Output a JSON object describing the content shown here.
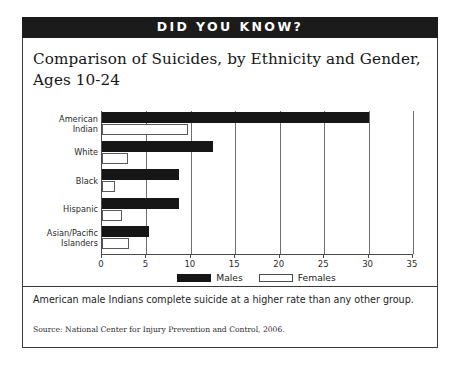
{
  "header": {
    "banner_title": "DID YOU KNOW?"
  },
  "chart_title": "Comparison of Suicides, by Ethnicity and Gender, Ages 10-24",
  "caption": "American male Indians complete suicide at a higher rate than any other group.",
  "source": "Source: National Center for Injury Prevention and Control, 2006.",
  "colors": {
    "males": "#161616",
    "females": "#ffffff",
    "female_border": "#5a5a5a",
    "banner_bg": "#1b1b1b",
    "banner_text": "#ffffff",
    "frame": "#3a3a3a",
    "grid": "#6e6e6e"
  },
  "chart_data": {
    "type": "bar",
    "orientation": "horizontal",
    "title": "Comparison of Suicides, by Ethnicity and Gender, Ages 10-24",
    "xlabel": "",
    "ylabel": "",
    "xlim": [
      0,
      35
    ],
    "xticks": [
      0,
      5,
      10,
      15,
      20,
      25,
      30,
      35
    ],
    "xtick_labels": [
      "0",
      "5",
      "10",
      "15",
      "20",
      "25",
      "30",
      "35"
    ],
    "grid": true,
    "legend_position": "bottom-center",
    "categories": [
      "American Indian",
      "White",
      "Black",
      "Hispanic",
      "Asian/Pacific Islanders"
    ],
    "category_label_lines": [
      [
        "American",
        "Indian"
      ],
      [
        "White"
      ],
      [
        "Black"
      ],
      [
        "Hispanic"
      ],
      [
        "Asian/Pacific",
        "Islanders"
      ]
    ],
    "series": [
      {
        "name": "Males",
        "values": [
          30.0,
          12.5,
          8.7,
          8.7,
          5.3
        ]
      },
      {
        "name": "Females",
        "values": [
          9.7,
          2.9,
          1.5,
          2.2,
          3.0
        ]
      }
    ],
    "legend": [
      "Males",
      "Females"
    ]
  }
}
